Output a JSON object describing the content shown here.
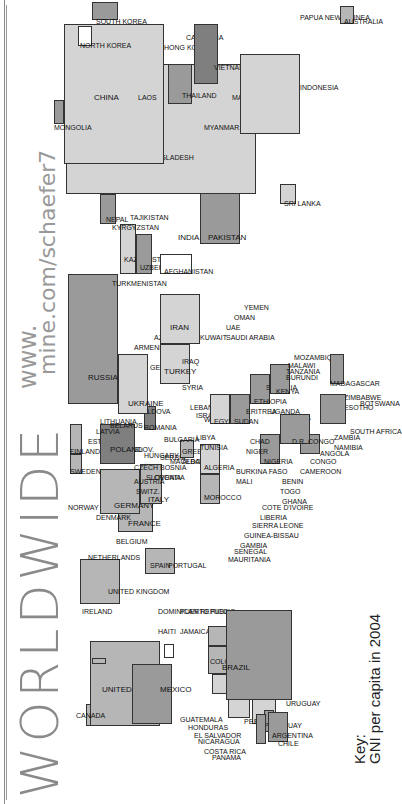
{
  "title": "WORLDWIDE",
  "url": {
    "line1": "www.",
    "line2": "mine.com/schaefer7"
  },
  "key": {
    "label": "Key:",
    "description": "GNI per capita in 2004"
  },
  "colors": {
    "light": "#d4d4d4",
    "mid_light": "#b6b6b6",
    "mid": "#9a9a9a",
    "dark": "#7f7f7f",
    "border": "#333333"
  },
  "countries": {
    "united_states": "UNITED STATES",
    "canada": "CANADA",
    "mexico": "MEXICO",
    "guatemala": "GUATEMALA",
    "honduras": "HONDURAS",
    "el_salvador": "EL SALVADOR",
    "nicaragua": "NICARAGUA",
    "costa_rica": "COSTA RICA",
    "panama": "PANAMA",
    "cuba": "CUBA",
    "haiti": "HAITI",
    "jamaica": "JAMAICA",
    "dominican_republic": "DOMINICAN REPUBLIC",
    "puerto_rico": "PUERTO RICO",
    "colombia": "COLOMBIA",
    "venezuela": "VENEZUELA",
    "ecuador": "ECUADOR",
    "peru": "PERU",
    "bolivia": "BOLIVIA",
    "brazil": "BRAZIL",
    "paraguay": "PARAGUAY",
    "uruguay": "URUGUAY",
    "argentina": "ARGENTINA",
    "chile": "CHILE",
    "ireland": "IRELAND",
    "united_kingdom": "UNITED KINGDOM",
    "portugal": "PORTUGAL",
    "spain": "SPAIN",
    "france": "FRANCE",
    "belgium": "BELGIUM",
    "netherlands": "NETHERLANDS",
    "switzerland": "SWITZ.",
    "italy": "ITALY",
    "germany": "GERMANY",
    "austria": "AUSTRIA",
    "denmark": "DENMARK",
    "norway": "NORWAY",
    "sweden": "SWEDEN",
    "finland": "FINLAND",
    "estonia": "ESTONIA",
    "latvia": "LATVIA",
    "lithuania": "LITHUANIA",
    "poland": "POLAND",
    "czech": "CZECH",
    "slovakia": "SLOV.",
    "hungary": "HUNGARY",
    "slovenia": "SLOVENIA",
    "croatia": "CROATIA",
    "bosnia": "BOSNIA",
    "serbia": "SERBIA",
    "macedonia": "MACEDONIA",
    "albania": "ALBANIA",
    "greece": "GREECE",
    "bulgaria": "BULGARIA",
    "romania": "ROMANIA",
    "moldova": "MOLDOVA",
    "belarus": "BELARUS",
    "ukraine": "UKRAINE",
    "russia": "RUSSIA",
    "georgia": "GEORGIA",
    "armenia": "ARMENIA",
    "azerbaijan": "AZER.",
    "turkey": "TURKEY",
    "syria": "SYRIA",
    "lebanon": "LEBANON",
    "israel": "ISRAEL",
    "west_bank": "WEST BANK",
    "jordan": "JORDAN",
    "iraq": "IRAQ",
    "iran": "IRAN",
    "kuwait": "KUWAIT",
    "saudi_arabia": "SAUDI ARABIA",
    "uae": "UAE",
    "oman": "OMAN",
    "yemen": "YEMEN",
    "kazakhstan": "KAZAKHSTAN",
    "uzbekistan": "UZBEKISTAN",
    "turkmenistan": "TURKMENISTAN",
    "kyrgyzstan": "KYRGYZSTAN",
    "tajikistan": "TAJIKISTAN",
    "afghanistan": "AFGHANISTAN",
    "pakistan": "PAKISTAN",
    "india": "INDIA",
    "nepal": "NEPAL",
    "sri_lanka": "SRI LANKA",
    "bangladesh": "BANGLADESH",
    "myanmar": "MYANMAR",
    "china": "CHINA",
    "mongolia": "MONGOLIA",
    "north_korea": "NORTH KOREA",
    "south_korea": "SOUTH KOREA",
    "hong_kong": "HONG KONG",
    "laos": "LAOS",
    "thailand": "THAILAND",
    "cambodia": "CAMBODIA",
    "vietnam": "VIETNAM",
    "malaysia": "MALAYSIA",
    "singapore": "SINGAPORE",
    "indonesia": "INDONESIA",
    "papua_new_guinea": "PAPUA NEW GUINEA",
    "australia": "AUSTRALIA",
    "morocco": "MOROCCO",
    "algeria": "ALGERIA",
    "tunisia": "TUNISIA",
    "libya": "LIBYA",
    "egypt": "EGYPT",
    "sudan": "SUDAN",
    "eritrea": "ERITREA",
    "ethiopia": "ETHIOPIA",
    "somalia": "SOMALIA",
    "kenya": "KENYA",
    "uganda": "UGANDA",
    "rwanda": "RWANDA",
    "burundi": "BURUNDI",
    "tanzania": "TANZANIA",
    "malawi": "MALAWI",
    "mozambique": "MOZAMBIQUE",
    "madagascar": "MADAGASCAR",
    "zimbabwe": "ZIMBABWE",
    "zambia": "ZAMBIA",
    "botswana": "BOTSWANA",
    "lesotho": "LESOTHO",
    "south_africa": "SOUTH AFRICA",
    "namibia": "NAMIBIA",
    "angola": "ANGOLA",
    "dr_congo": "D.R. CONGO",
    "congo": "CONGO",
    "cameroon": "CAMEROON",
    "nigeria": "NIGERIA",
    "niger": "NIGER",
    "chad": "CHAD",
    "mali": "MALI",
    "burkina_faso": "BURKINA FASO",
    "benin": "BENIN",
    "togo": "TOGO",
    "ghana": "GHANA",
    "cote_divoire": "COTE D'IVOIRE",
    "liberia": "LIBERIA",
    "sierra_leone": "SIERRA LEONE",
    "guinea_bissau": "GUINEA-BISSAU",
    "gambia": "GAMBIA",
    "senegal": "SENEGAL",
    "mauritania": "MAURITANIA"
  }
}
